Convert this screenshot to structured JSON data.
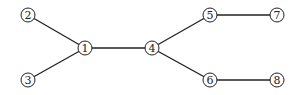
{
  "diagram": {
    "type": "tree-graph",
    "nodes": [
      {
        "id": "1",
        "label": "1",
        "x": 85,
        "y": 48
      },
      {
        "id": "2",
        "label": "2",
        "x": 28,
        "y": 15
      },
      {
        "id": "3",
        "label": "3",
        "x": 28,
        "y": 80
      },
      {
        "id": "4",
        "label": "4",
        "x": 152,
        "y": 48
      },
      {
        "id": "5",
        "label": "5",
        "x": 210,
        "y": 15
      },
      {
        "id": "6",
        "label": "6",
        "x": 210,
        "y": 80
      },
      {
        "id": "7",
        "label": "7",
        "x": 277,
        "y": 15
      },
      {
        "id": "8",
        "label": "8",
        "x": 277,
        "y": 80
      }
    ],
    "edges": [
      {
        "from": "2",
        "to": "1"
      },
      {
        "from": "3",
        "to": "1"
      },
      {
        "from": "1",
        "to": "4"
      },
      {
        "from": "4",
        "to": "5"
      },
      {
        "from": "4",
        "to": "6"
      },
      {
        "from": "5",
        "to": "7"
      },
      {
        "from": "6",
        "to": "8"
      }
    ],
    "node_radius": 7
  }
}
